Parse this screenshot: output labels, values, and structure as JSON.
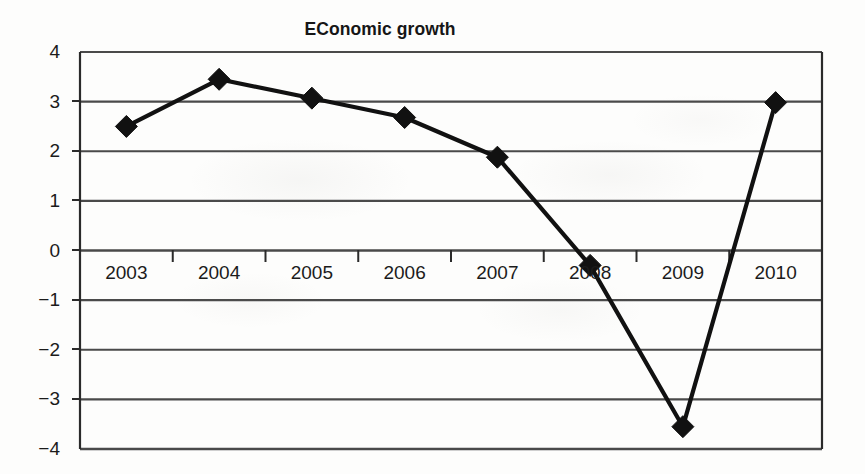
{
  "chart_data": {
    "type": "line",
    "title": "EConomic growth",
    "xlabel": "",
    "ylabel": "",
    "categories": [
      "2003",
      "2004",
      "2005",
      "2006",
      "2007",
      "2008",
      "2009",
      "2010"
    ],
    "values": [
      2.5,
      3.45,
      3.07,
      2.68,
      1.88,
      -0.3,
      -3.55,
      2.98
    ],
    "series": [
      {
        "name": "Economic growth",
        "values": [
          2.5,
          3.45,
          3.07,
          2.68,
          1.88,
          -0.3,
          -3.55,
          2.98
        ]
      }
    ],
    "ylim": [
      -4,
      4
    ],
    "ytick_labels": [
      "4",
      "3",
      "2",
      "1",
      "0",
      "−1",
      "−2",
      "−3",
      "−4"
    ],
    "ytick_values": [
      4,
      3,
      2,
      1,
      0,
      -1,
      -2,
      -3,
      -4
    ],
    "grid": true,
    "grid_axis": "y",
    "legend": false,
    "legend_position": "none",
    "marker": "diamond",
    "line_color": "#111111",
    "marker_color": "#111111",
    "grid_color": "#4a4a4a",
    "axis_color": "#2a2a2a",
    "background_color": "#fdfdfc",
    "annotations": []
  },
  "axis": {
    "x_label_baseline_value": 0
  }
}
